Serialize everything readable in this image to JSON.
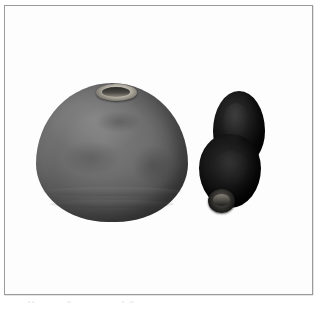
{
  "page": {
    "background_color": "#ffffff",
    "width": 323,
    "height": 315
  },
  "plate": {
    "frame_color": "#9a9a9a",
    "background_color": "#fdfdfd",
    "caption_text": "the clipped running text line at the page foot"
  },
  "objects": [
    {
      "id": "vessel-large",
      "name": "large dome-shaped ceramic pot",
      "position": "left",
      "dominant_color": "#6d6d6d",
      "shade": "mid gray",
      "features": [
        "narrow circular mouth at apex",
        "rounded dome body",
        "turning bands near base",
        "mottled surface"
      ]
    },
    {
      "id": "vessel-small",
      "name": "dark gourd-shaped vessel",
      "position": "right",
      "dominant_color": "#161616",
      "shade": "near black",
      "features": [
        "double-lobed gourd silhouette",
        "small circular spout at base",
        "glossy highlights"
      ]
    }
  ]
}
